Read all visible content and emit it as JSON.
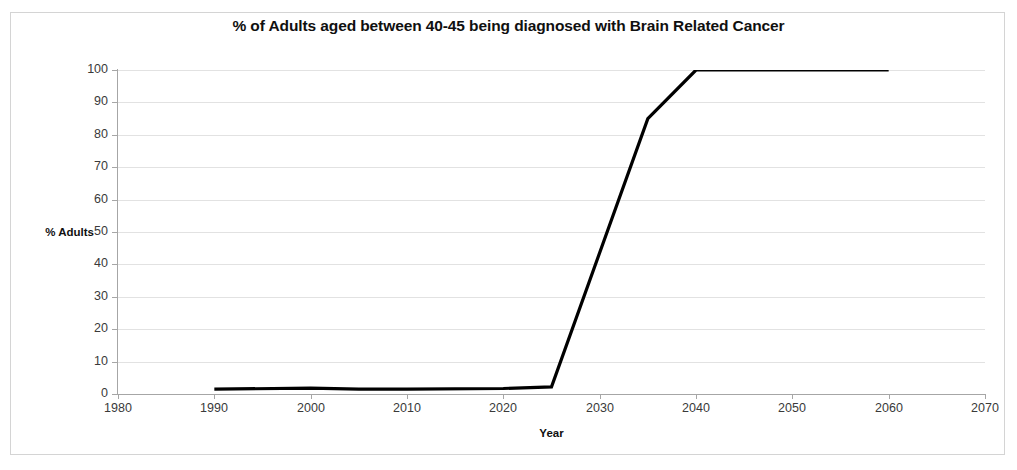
{
  "chart_data": {
    "type": "line",
    "title": "% of Adults aged between 40-45 being diagnosed with Brain Related Cancer",
    "xlabel": "Year",
    "ylabel": "% Adults",
    "xlim": [
      1980,
      2070
    ],
    "ylim": [
      0,
      100
    ],
    "xticks": [
      1980,
      1990,
      2000,
      2010,
      2020,
      2030,
      2040,
      2050,
      2060,
      2070
    ],
    "yticks": [
      0,
      10,
      20,
      30,
      40,
      50,
      60,
      70,
      80,
      90,
      100
    ],
    "grid": "horizontal",
    "legend": "none",
    "series": [
      {
        "name": "% Adults diagnosed",
        "color": "#000000",
        "x": [
          1990,
          2000,
          2005,
          2010,
          2020,
          2025,
          2035,
          2040,
          2060
        ],
        "values": [
          1.5,
          1.8,
          1.5,
          1.5,
          1.7,
          2.2,
          85,
          100,
          100
        ]
      }
    ]
  },
  "axes": {
    "y_tick_labels": [
      "100",
      "90",
      "80",
      "70",
      "60",
      "50",
      "40",
      "30",
      "20",
      "10",
      "0"
    ],
    "x_tick_labels": [
      "1980",
      "1990",
      "2000",
      "2010",
      "2020",
      "2030",
      "2040",
      "2050",
      "2060",
      "2070"
    ]
  }
}
